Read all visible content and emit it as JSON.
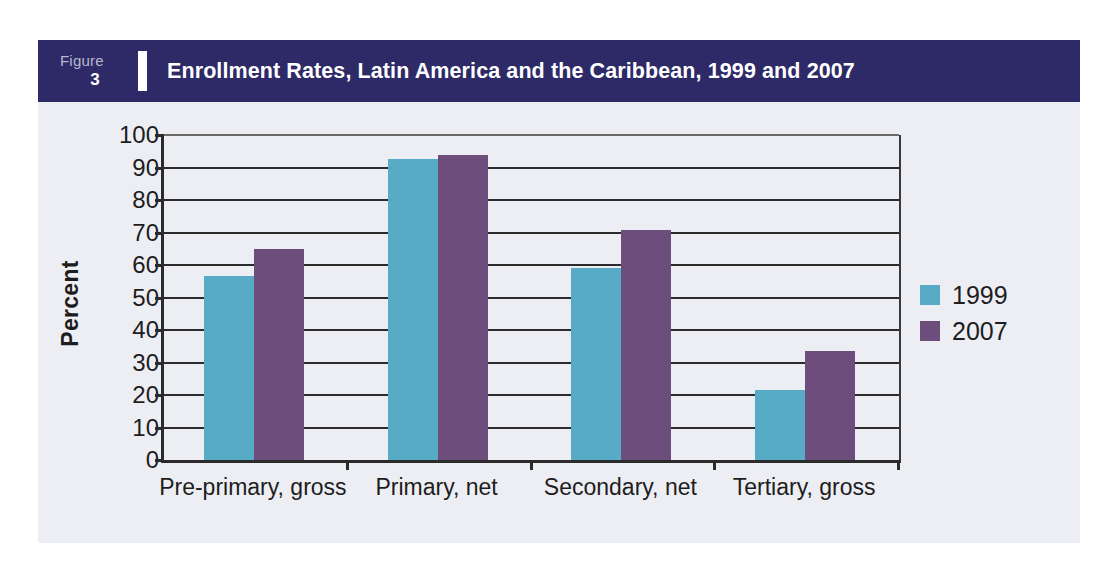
{
  "figure": {
    "tag_word": "Figure",
    "tag_number": "3",
    "title": "Enrollment Rates, Latin America and the Caribbean, 1999 and 2007",
    "header_color": "#2E2A68",
    "panel_color": "#EDEEF4"
  },
  "chart_data": {
    "type": "bar",
    "title": "Enrollment Rates, Latin America and the Caribbean, 1999 and 2007",
    "xlabel": "",
    "ylabel": "Percent",
    "ylim": [
      0,
      100
    ],
    "yticks": [
      0,
      10,
      20,
      30,
      40,
      50,
      60,
      70,
      80,
      90,
      100
    ],
    "ytick_labels": [
      "0",
      "10",
      "20",
      "30",
      "40",
      "50",
      "60",
      "70",
      "80",
      "90",
      "100"
    ],
    "grid": true,
    "legend_position": "right",
    "categories": [
      "Pre-primary, gross",
      "Primary, net",
      "Secondary, net",
      "Tertiary, gross"
    ],
    "series": [
      {
        "name": "1999",
        "color": "#58ABC6",
        "values": [
          56.5,
          92.5,
          59,
          21.5
        ]
      },
      {
        "name": "2007",
        "color": "#6C4D7B",
        "values": [
          65,
          94,
          70.7,
          33.5
        ]
      }
    ]
  },
  "legend": {
    "entries": [
      {
        "label": "1999",
        "color": "#58ABC6"
      },
      {
        "label": "2007",
        "color": "#6C4D7B"
      }
    ]
  }
}
